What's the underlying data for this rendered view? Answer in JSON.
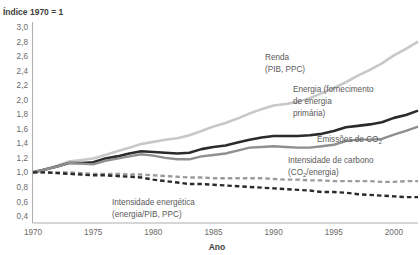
{
  "chart_data": {
    "type": "line",
    "title": "Índice 1970 = 1",
    "xlabel": "Ano",
    "ylabel": "",
    "xlim": [
      1970,
      2002
    ],
    "ylim": [
      0.4,
      3.0
    ],
    "grid": false,
    "legend_position": "inline-annotations",
    "x_ticks": [
      "1970",
      "1975",
      "1980",
      "1985",
      "1990",
      "1995",
      "2000"
    ],
    "x_tick_values": [
      1970,
      1975,
      1980,
      1985,
      1990,
      1995,
      2000
    ],
    "y_ticks": [
      "3,0",
      "2,8",
      "2,6",
      "2,4",
      "2,2",
      "2,0",
      "1,8",
      "1,6",
      "1,4",
      "1,2",
      "1,0",
      "0,8",
      "0,6",
      "0,4"
    ],
    "y_tick_values": [
      3.0,
      2.8,
      2.6,
      2.4,
      2.2,
      2.0,
      1.8,
      1.6,
      1.4,
      1.2,
      1.0,
      0.8,
      0.6,
      0.4
    ],
    "x": [
      1970,
      1971,
      1972,
      1973,
      1974,
      1975,
      1976,
      1977,
      1978,
      1979,
      1980,
      1981,
      1982,
      1983,
      1984,
      1985,
      1986,
      1987,
      1988,
      1989,
      1990,
      1991,
      1992,
      1993,
      1994,
      1995,
      1996,
      1997,
      1998,
      1999,
      2000,
      2001,
      2002
    ],
    "series": [
      {
        "name": "Renda (PIB, PPC)",
        "label_lines": [
          "Renda",
          "(PIB, PPC)"
        ],
        "color": "#c8c8c8",
        "style": "solid",
        "width": 2.6,
        "values": [
          1.0,
          1.04,
          1.09,
          1.15,
          1.17,
          1.19,
          1.24,
          1.29,
          1.34,
          1.39,
          1.42,
          1.45,
          1.47,
          1.51,
          1.57,
          1.63,
          1.68,
          1.74,
          1.81,
          1.87,
          1.92,
          1.94,
          1.97,
          2.02,
          2.09,
          2.16,
          2.24,
          2.33,
          2.41,
          2.5,
          2.61,
          2.7,
          2.8
        ]
      },
      {
        "name": "Energia (fornecimento de energia primária)",
        "label_lines": [
          "Energia (fornecimento",
          "de energia",
          "primária)"
        ],
        "color": "#2b2b2b",
        "style": "solid",
        "width": 2.6,
        "values": [
          1.0,
          1.04,
          1.08,
          1.13,
          1.13,
          1.14,
          1.19,
          1.22,
          1.26,
          1.29,
          1.28,
          1.27,
          1.26,
          1.27,
          1.32,
          1.35,
          1.37,
          1.41,
          1.45,
          1.48,
          1.5,
          1.5,
          1.5,
          1.51,
          1.53,
          1.57,
          1.62,
          1.64,
          1.66,
          1.69,
          1.75,
          1.79,
          1.85
        ]
      },
      {
        "name": "Emissões de CO2",
        "label_lines": [
          "Emissões de CO₂"
        ],
        "color": "#8f8f8f",
        "style": "solid",
        "width": 2.4,
        "values": [
          1.0,
          1.04,
          1.08,
          1.13,
          1.12,
          1.11,
          1.16,
          1.19,
          1.22,
          1.25,
          1.23,
          1.2,
          1.18,
          1.18,
          1.22,
          1.24,
          1.26,
          1.3,
          1.34,
          1.35,
          1.36,
          1.35,
          1.34,
          1.34,
          1.36,
          1.38,
          1.43,
          1.45,
          1.45,
          1.46,
          1.52,
          1.57,
          1.63
        ]
      },
      {
        "name": "Intensidade de carbono (CO2/energia)",
        "label_lines": [
          "Intensidade de carbono",
          "(CO₂/energia)"
        ],
        "color": "#9b9b9b",
        "style": "dashed",
        "width": 2.4,
        "values": [
          1.0,
          1.0,
          1.0,
          1.0,
          0.99,
          0.98,
          0.98,
          0.98,
          0.97,
          0.97,
          0.96,
          0.95,
          0.94,
          0.93,
          0.93,
          0.92,
          0.92,
          0.92,
          0.92,
          0.92,
          0.91,
          0.9,
          0.9,
          0.89,
          0.89,
          0.88,
          0.88,
          0.88,
          0.88,
          0.87,
          0.87,
          0.88,
          0.88
        ]
      },
      {
        "name": "Intensidade energética (energia/PIB, PPC)",
        "label_lines": [
          "Intensidade energética",
          "(energia/PIB, PPC)"
        ],
        "color": "#2b2b2b",
        "style": "dashed",
        "width": 2.4,
        "values": [
          1.0,
          1.0,
          0.99,
          0.98,
          0.97,
          0.96,
          0.96,
          0.95,
          0.94,
          0.93,
          0.9,
          0.88,
          0.86,
          0.84,
          0.84,
          0.83,
          0.82,
          0.81,
          0.8,
          0.79,
          0.78,
          0.77,
          0.76,
          0.75,
          0.73,
          0.73,
          0.72,
          0.7,
          0.69,
          0.68,
          0.67,
          0.66,
          0.66
        ]
      }
    ],
    "annotations": [
      {
        "text": "Renda",
        "series": "Renda (PIB, PPC)"
      },
      {
        "text": "(PIB, PPC)",
        "series": "Renda (PIB, PPC)"
      },
      {
        "text": "Energia (fornecimento",
        "series": "Energia (fornecimento de energia primária)"
      },
      {
        "text": "de energia",
        "series": "Energia (fornecimento de energia primária)"
      },
      {
        "text": "primária)",
        "series": "Energia (fornecimento de energia primária)"
      },
      {
        "text": "Emissões de CO₂",
        "series": "Emissões de CO2"
      },
      {
        "text": "Intensidade de carbono",
        "series": "Intensidade de carbono (CO2/energia)"
      },
      {
        "text": "(CO₂/energia)",
        "series": "Intensidade de carbono (CO2/energia)"
      },
      {
        "text": "Intensidade energética",
        "series": "Intensidade energética (energia/PIB, PPC)"
      },
      {
        "text": "(energia/PIB, PPC)",
        "series": "Intensidade energética (energia/PIB, PPC)"
      }
    ]
  },
  "labels": {
    "title": "Índice 1970 = 1",
    "xaxis": "Ano",
    "renda_l1": "Renda",
    "renda_l2": "(PIB, PPC)",
    "energia_l1": "Energia (fornecimento",
    "energia_l2": "de energia",
    "energia_l3": "primária)",
    "co2_l1": "Emissões de CO",
    "co2_sub": "2",
    "carbono_l1": "Intensidade de carbono",
    "carbono_l2a": "(CO",
    "carbono_sub": "2",
    "carbono_l2b": "/energia)",
    "intens_l1": "Intensidade energética",
    "intens_l2": "(energia/PIB, PPC)"
  }
}
